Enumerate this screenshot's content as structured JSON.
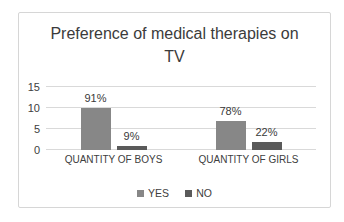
{
  "chart_data": {
    "type": "bar",
    "title": "Preference of medical therapies on TV",
    "categories": [
      "QUANTITY OF BOYS",
      "QUANTITY OF GIRLS"
    ],
    "series": [
      {
        "name": "YES",
        "color": "#878787",
        "values": [
          10,
          7
        ],
        "labels": [
          "91%",
          "78%"
        ]
      },
      {
        "name": "NO",
        "color": "#5a5a5a",
        "values": [
          1,
          2
        ],
        "labels": [
          "9%",
          "22%"
        ]
      }
    ],
    "y_axis": {
      "min": 0,
      "max": 15,
      "ticks": [
        0,
        5,
        10,
        15
      ]
    },
    "grid": true,
    "legend_position": "bottom",
    "colors": {
      "gridline": "#d9d9d9",
      "frame_border": "#d6d6d6",
      "title_text": "#3b3b3b",
      "axis_text": "#404040",
      "label_text": "#3a3a3a",
      "background": "#ffffff"
    }
  }
}
